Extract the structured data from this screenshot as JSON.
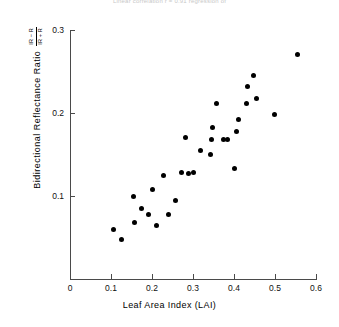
{
  "caption": {
    "top_text": "Linear correlation r = 0.91 regression of"
  },
  "axis": {
    "x_title": "Leaf Area Index (LAI)",
    "y_title": "Bidirectional Reflectance Ratio",
    "y_fraction_numerator": "IR − R",
    "y_fraction_denominator": "IR + R",
    "x_ticks": [
      "0",
      "0.1",
      "0.2",
      "0.3",
      "0.4",
      "0.5",
      "0.6"
    ],
    "y_ticks": [
      "0.1",
      "0.2",
      "0.3"
    ]
  },
  "chart_data": {
    "type": "scatter",
    "title": "",
    "xlabel": "Leaf Area Index (LAI)",
    "ylabel": "Bidirectional Reflectance Ratio (IR - R)/(IR + R)",
    "xlim": [
      0,
      0.6
    ],
    "ylim": [
      0,
      0.3
    ],
    "xticks": [
      0,
      0.1,
      0.2,
      0.3,
      0.4,
      0.5,
      0.6
    ],
    "yticks": [
      0.1,
      0.2,
      0.3
    ],
    "grid": false,
    "legend": false,
    "marker": "filled-circle",
    "marker_color": "#000000",
    "points": [
      {
        "x": 0.105,
        "y": 0.06
      },
      {
        "x": 0.125,
        "y": 0.047
      },
      {
        "x": 0.155,
        "y": 0.1
      },
      {
        "x": 0.158,
        "y": 0.068
      },
      {
        "x": 0.175,
        "y": 0.085
      },
      {
        "x": 0.192,
        "y": 0.078
      },
      {
        "x": 0.2,
        "y": 0.108
      },
      {
        "x": 0.212,
        "y": 0.065
      },
      {
        "x": 0.228,
        "y": 0.125
      },
      {
        "x": 0.24,
        "y": 0.078
      },
      {
        "x": 0.258,
        "y": 0.095
      },
      {
        "x": 0.272,
        "y": 0.128
      },
      {
        "x": 0.282,
        "y": 0.17
      },
      {
        "x": 0.29,
        "y": 0.127
      },
      {
        "x": 0.3,
        "y": 0.128
      },
      {
        "x": 0.318,
        "y": 0.155
      },
      {
        "x": 0.343,
        "y": 0.15
      },
      {
        "x": 0.345,
        "y": 0.168
      },
      {
        "x": 0.347,
        "y": 0.183
      },
      {
        "x": 0.358,
        "y": 0.212
      },
      {
        "x": 0.375,
        "y": 0.168
      },
      {
        "x": 0.383,
        "y": 0.168
      },
      {
        "x": 0.4,
        "y": 0.133
      },
      {
        "x": 0.405,
        "y": 0.178
      },
      {
        "x": 0.41,
        "y": 0.192
      },
      {
        "x": 0.43,
        "y": 0.212
      },
      {
        "x": 0.432,
        "y": 0.232
      },
      {
        "x": 0.448,
        "y": 0.245
      },
      {
        "x": 0.455,
        "y": 0.218
      },
      {
        "x": 0.498,
        "y": 0.198
      },
      {
        "x": 0.555,
        "y": 0.27
      }
    ]
  }
}
